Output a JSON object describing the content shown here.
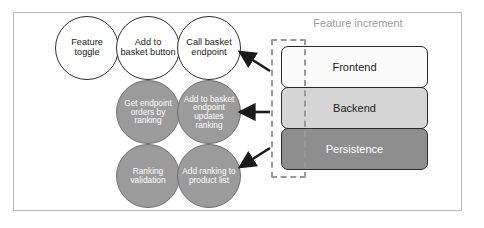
{
  "diagram": {
    "frame": {
      "border_color": "#b9b9b9"
    },
    "colors": {
      "circle_outline_fill": "#ffffff",
      "circle_outline_stroke": "#2e2e2e",
      "circle_filled_fill": "#9b9b9b",
      "circle_filled_text": "#ffffff",
      "frontend_fill": "#fbfbfb",
      "backend_fill": "#d6d6d6",
      "persistence_fill": "#8e8e8e",
      "dashed_slice": "#9a9a9a",
      "label_gray": "#9d9d9d",
      "arrow": "#1a1a1a"
    },
    "stories": [
      {
        "id": "feature-toggle",
        "label": "Feature toggle",
        "style": "outline",
        "row": 1,
        "col": 1
      },
      {
        "id": "add-to-basket-button",
        "label": "Add to basket button",
        "style": "outline",
        "row": 1,
        "col": 2
      },
      {
        "id": "call-basket-endpoint",
        "label": "Call basket endpoint",
        "style": "outline",
        "row": 1,
        "col": 3
      },
      {
        "id": "get-endpoint-orders-by-ranking",
        "label": "Get endpoint orders by ranking",
        "style": "filled",
        "row": 2,
        "col": 2
      },
      {
        "id": "add-to-basket-endpoint-updates-ranking",
        "label": "Add to basket endpoint updates ranking",
        "style": "filled",
        "row": 2,
        "col": 3
      },
      {
        "id": "ranking-validation",
        "label": "Ranking validation",
        "style": "filled",
        "row": 3,
        "col": 2
      },
      {
        "id": "add-ranking-to-product-list",
        "label": "Add ranking to product list",
        "style": "filled",
        "row": 3,
        "col": 3
      }
    ],
    "increment": {
      "label": "Feature increment",
      "layers": [
        {
          "id": "frontend",
          "label": "Frontend",
          "tone": "light"
        },
        {
          "id": "backend",
          "label": "Backend",
          "tone": "medium"
        },
        {
          "id": "persistence",
          "label": "Persistence",
          "tone": "dark"
        }
      ]
    },
    "arrows": [
      {
        "id": "arrow-frontend-to-stories",
        "direction": "up-left",
        "target": "frontend"
      },
      {
        "id": "arrow-backend-to-stories",
        "direction": "left",
        "target": "backend"
      },
      {
        "id": "arrow-persistence-to-stories",
        "direction": "down-left",
        "target": "persistence"
      }
    ]
  }
}
